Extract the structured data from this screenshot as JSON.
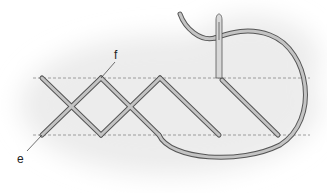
{
  "diagram": {
    "labels": [
      {
        "id": "f",
        "text": "f"
      },
      {
        "id": "e",
        "text": "e"
      }
    ],
    "colors": {
      "thread_fill": "#c4c4c4",
      "thread_outline": "#555555",
      "guide_line": "#888888",
      "background_cloud": "#eeeeee"
    }
  }
}
